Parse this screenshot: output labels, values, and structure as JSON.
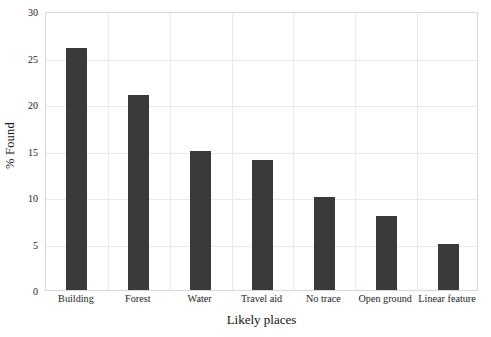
{
  "chart_data": {
    "type": "bar",
    "title": "",
    "subtitle": "",
    "xlabel": "Likely places",
    "ylabel": "% Found",
    "categories": [
      "Building",
      "Forest",
      "Water",
      "Travel aid",
      "No trace",
      "Open ground",
      "Linear feature"
    ],
    "values": [
      26,
      21,
      15,
      14,
      10,
      8,
      5
    ],
    "ylim": [
      0,
      30
    ],
    "yticks": [
      0,
      5,
      10,
      15,
      20,
      25,
      30
    ],
    "ytick_labels": [
      "0",
      "5",
      "10",
      "15",
      "20",
      "25",
      "30"
    ],
    "grid": true,
    "grid_axis": "both",
    "legend": false,
    "legend_position": "none",
    "bar_color": "#3a3a3a",
    "grid_color": "#e9e9e9",
    "frame_color": "#d8d8d8",
    "background_color": "#ffffff",
    "text_color": "#1a1a1a"
  }
}
